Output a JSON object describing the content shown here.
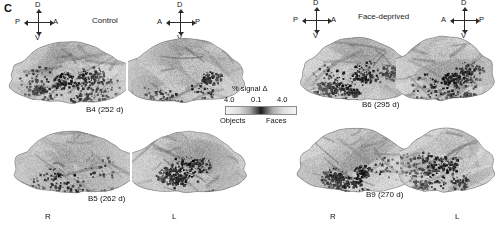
{
  "panel": {
    "letter": "C",
    "caption_fragment": ""
  },
  "groups": [
    {
      "id": "control",
      "title": "Control"
    },
    {
      "id": "deprived",
      "title": "Face-deprived"
    }
  ],
  "compasses": [
    {
      "id": "compass-ctrl-left",
      "north": "D",
      "south": "V",
      "west": "P",
      "east": "A"
    },
    {
      "id": "compass-ctrl-right",
      "north": "D",
      "south": "V",
      "west": "A",
      "east": "P"
    },
    {
      "id": "compass-dep-left",
      "north": "D",
      "south": "V",
      "west": "P",
      "east": "A"
    },
    {
      "id": "compass-dep-right",
      "north": "D",
      "south": "V",
      "west": "A",
      "east": "P"
    }
  ],
  "subjects": [
    {
      "id": "b4",
      "label": "B4 (252 d)",
      "group": "control",
      "age_days": 252
    },
    {
      "id": "b5",
      "label": "B5 (262 d)",
      "group": "control",
      "age_days": 262
    },
    {
      "id": "b6",
      "label": "B6 (295 d)",
      "group": "deprived",
      "age_days": 295
    },
    {
      "id": "b9",
      "label": "B9 (270 d)",
      "group": "deprived",
      "age_days": 270
    }
  ],
  "hemispheres": {
    "right": "R",
    "left": "L"
  },
  "legend": {
    "title": "% signal Δ",
    "tick_low": "4.0",
    "tick_mid": "0.1",
    "tick_high": "4.0",
    "end_left": "Objects",
    "end_right": "Faces",
    "colors": {
      "extreme": "#f4f4f4",
      "center": "#1b1b1b"
    }
  }
}
